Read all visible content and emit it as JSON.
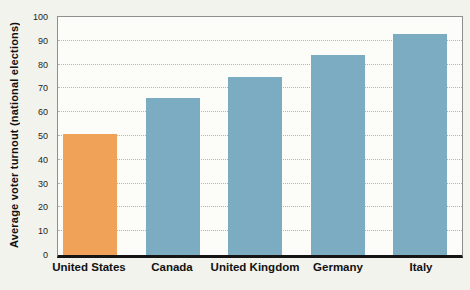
{
  "figure": {
    "background": "#f2f3ed",
    "plot_background": "#fcfcf9"
  },
  "chart_data": {
    "type": "bar",
    "categories": [
      "United States",
      "Canada",
      "United Kingdom",
      "Germany",
      "Italy"
    ],
    "values": [
      51,
      66,
      75,
      84,
      93
    ],
    "title": "",
    "xlabel": "",
    "ylabel": "Average voter turnout (national elections)",
    "ylim": [
      0,
      100
    ],
    "ytick_step": 10,
    "ytick_labels": [
      "0",
      "10",
      "20",
      "30",
      "40",
      "50",
      "60",
      "70",
      "80",
      "90",
      "100"
    ],
    "grid": "horizontal-dotted",
    "legend_position": "none",
    "bar_colors": [
      "#f0a259",
      "#7cacc1",
      "#7cacc1",
      "#7cacc1",
      "#7cacc1"
    ],
    "highlight_color": "#f0a259",
    "series_color": "#7cacc1",
    "axis_line_color": "#151515",
    "frame_color": "#8f8f8f",
    "gridline_color": "#b4b4b4"
  }
}
